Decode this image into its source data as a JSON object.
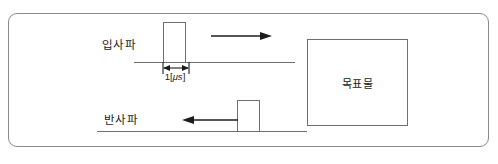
{
  "figure": {
    "title": "",
    "incident_wave": {
      "label": "입사파",
      "arrow_direction": "right",
      "pulse_width_label": "1[",
      "pulse_width_unit": "μs",
      "pulse_width_label_close": "]"
    },
    "reflected_wave": {
      "label": "반사파",
      "arrow_direction": "left"
    },
    "target": {
      "label": "목표물"
    },
    "colors": {
      "frame_border": "#8a8a8a",
      "line": "#6f6f6f",
      "text": "#1c1c1c",
      "arrow": "#1c1c1c",
      "background": "#ffffff"
    }
  }
}
